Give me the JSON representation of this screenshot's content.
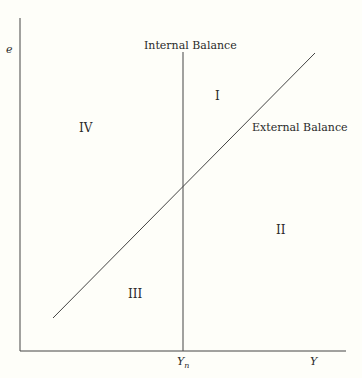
{
  "diagram": {
    "type": "quadrant-diagram",
    "axes": {
      "y_label": "e",
      "x_label": "Y",
      "x_tick_label_base": "Y",
      "x_tick_label_sub": "n"
    },
    "curves": [
      {
        "name": "Internal Balance",
        "kind": "vertical line at Y_n"
      },
      {
        "name": "External Balance",
        "kind": "upward-sloping line"
      }
    ],
    "regions": [
      "I",
      "II",
      "III",
      "IV"
    ],
    "colors": {
      "line": "#333333",
      "background": "#fefef9",
      "text": "#2a2a2a"
    }
  }
}
